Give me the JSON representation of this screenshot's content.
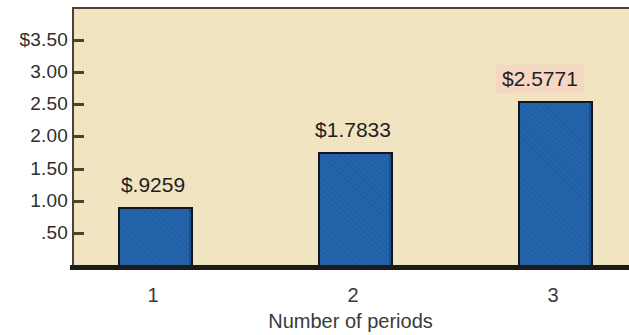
{
  "chart_data": {
    "type": "bar",
    "title": "",
    "subtitle": "",
    "xlabel": "Number of periods",
    "ylabel": "",
    "categories": [
      "1",
      "2",
      "3"
    ],
    "values": [
      0.9259,
      1.7833,
      2.5771
    ],
    "data_labels": [
      "$.9259",
      "$1.7833",
      "$2.5771"
    ],
    "highlighted_index": 2,
    "ylim": [
      0,
      3.75
    ],
    "y_ticks": [
      0.5,
      1.0,
      1.5,
      2.0,
      2.5,
      3.0,
      3.5
    ],
    "y_tick_labels": [
      ".50",
      "1.00",
      "1.50",
      "2.00",
      "2.50",
      "3.00",
      "$3.50"
    ],
    "grid": false,
    "legend": "none",
    "series": [
      {
        "name": "Future value of $1",
        "values": [
          0.9259,
          1.7833,
          2.5771
        ]
      }
    ]
  },
  "axes": {
    "y": {
      "ticks": [
        {
          "label": "$3.50",
          "value": 3.5
        },
        {
          "label": "3.00",
          "value": 3.0
        },
        {
          "label": "2.50",
          "value": 2.5
        },
        {
          "label": "2.00",
          "value": 2.0
        },
        {
          "label": "1.50",
          "value": 1.5
        },
        {
          "label": "1.00",
          "value": 1.0
        },
        {
          "label": ".50",
          "value": 0.5
        }
      ]
    },
    "x": {
      "title": "Number of periods",
      "ticks": [
        {
          "label": "1"
        },
        {
          "label": "2"
        },
        {
          "label": "3"
        }
      ]
    }
  },
  "bars": [
    {
      "category": "1",
      "value": 0.9259,
      "label": "$.9259",
      "highlighted": false
    },
    {
      "category": "2",
      "value": 1.7833,
      "label": "$1.7833",
      "highlighted": false
    },
    {
      "category": "3",
      "value": 2.5771,
      "label": "$2.5771",
      "highlighted": true
    }
  ],
  "colors": {
    "bar_fill": "#2061a9",
    "bar_border": "#14161c",
    "plot_background": "#f2e6c2",
    "axis_line": "#1b1b18",
    "highlight_background": "#f5d7c4",
    "text": "#2e2e2e"
  }
}
